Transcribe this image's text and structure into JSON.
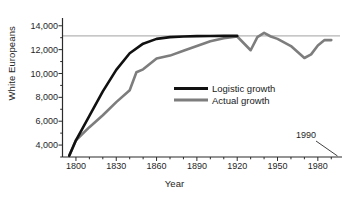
{
  "chart_data": {
    "type": "line",
    "title": "",
    "xlabel": "Year",
    "ylabel": "White Europeans",
    "xlim": [
      1790,
      1995
    ],
    "ylim": [
      3000,
      14400
    ],
    "grid": false,
    "x_ticks": [
      1800,
      1830,
      1860,
      1890,
      1920,
      1950,
      1980
    ],
    "x_tick_labels": [
      "1800",
      "1830",
      "1860",
      "1890",
      "1920",
      "1950",
      "1980"
    ],
    "x_minor_tick_step": 10,
    "y_ticks": [
      4000,
      6000,
      8000,
      10000,
      12000,
      14000
    ],
    "y_tick_labels": [
      "4,000",
      "6,000",
      "8,000",
      "10,000",
      "12,000",
      "14,000"
    ],
    "y_minor_tick_step": 1000,
    "legend_position": "center",
    "annotations": [
      {
        "text": "1990",
        "x": 1972,
        "y": 4600,
        "points_to_x": 1992,
        "points_to_y": 3000
      }
    ],
    "reference_line": {
      "name": "carrying-capacity-asymptote",
      "y": 13150,
      "color": "#b4b4b4"
    },
    "series": [
      {
        "name": "Logistic growth",
        "color": "#111111",
        "x": [
          1795,
          1800,
          1810,
          1820,
          1830,
          1840,
          1850,
          1860,
          1870,
          1880,
          1890,
          1900,
          1910,
          1920
        ],
        "values": [
          3100,
          4400,
          6450,
          8500,
          10300,
          11700,
          12500,
          12900,
          13050,
          13100,
          13130,
          13140,
          13150,
          13150
        ]
      },
      {
        "name": "Actual growth",
        "color": "#7d7d7d",
        "x": [
          1795,
          1800,
          1810,
          1820,
          1830,
          1840,
          1845,
          1850,
          1860,
          1870,
          1880,
          1890,
          1900,
          1910,
          1920,
          1930,
          1935,
          1940,
          1945,
          1950,
          1960,
          1970,
          1975,
          1980,
          1985,
          1990
        ],
        "values": [
          3100,
          4400,
          5500,
          6500,
          7600,
          8600,
          10100,
          10350,
          11250,
          11500,
          11900,
          12300,
          12700,
          12950,
          13100,
          11950,
          13050,
          13400,
          13100,
          12900,
          12300,
          11300,
          11600,
          12350,
          12800,
          12800
        ]
      }
    ]
  },
  "legend": {
    "items": [
      {
        "label": "Logistic growth",
        "color": "#111111"
      },
      {
        "label": "Actual growth",
        "color": "#7d7d7d"
      }
    ]
  },
  "axes": {
    "x_title": "Year",
    "y_title": "White Europeans"
  }
}
